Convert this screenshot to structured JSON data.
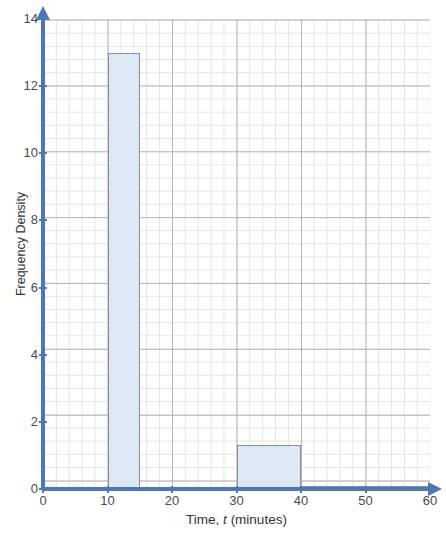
{
  "chart_data": {
    "type": "bar",
    "subtype": "histogram",
    "title": "",
    "xlabel": "Time, t (minutes)",
    "xlabel_parts": {
      "pre": "Time, ",
      "var": "t",
      "post": " (minutes)"
    },
    "ylabel": "Frequency Density",
    "xlim": [
      0,
      60
    ],
    "ylim": [
      0,
      14
    ],
    "x_ticks": [
      0,
      10,
      20,
      30,
      40,
      50,
      60
    ],
    "x_tick_labels": [
      "0",
      "10",
      "20",
      "30",
      "40",
      "50",
      "60"
    ],
    "y_ticks": [
      0,
      2,
      4,
      6,
      8,
      10,
      12,
      14
    ],
    "y_tick_labels": [
      "0",
      "2",
      "4",
      "6",
      "8",
      "10",
      "12",
      "14"
    ],
    "x_major_step": 10,
    "y_major_step": 2,
    "x_minor_step": 2,
    "y_minor_step": 0.4,
    "grid": true,
    "grid_minor": true,
    "legend": false,
    "bars": [
      {
        "label": "10-15",
        "x_start": 10,
        "x_end": 15,
        "height": 13
      },
      {
        "label": "30-40",
        "x_start": 30,
        "x_end": 40,
        "height": 1.3
      },
      {
        "label": "40-60",
        "x_start": 40,
        "x_end": 60,
        "height": 0.1
      }
    ],
    "values": [
      13,
      1.3,
      0.1
    ],
    "categories": [
      "10-15",
      "30-40",
      "40-60"
    ],
    "colors": {
      "bar_fill": "#dce9f5",
      "bar_stroke": "#8a8f96",
      "axis": "#4a78b4",
      "grid_major": "#b9b4b4",
      "grid_minor": "#e9e2e2",
      "text": "#4a4a4a",
      "background": "#ffffff"
    }
  }
}
